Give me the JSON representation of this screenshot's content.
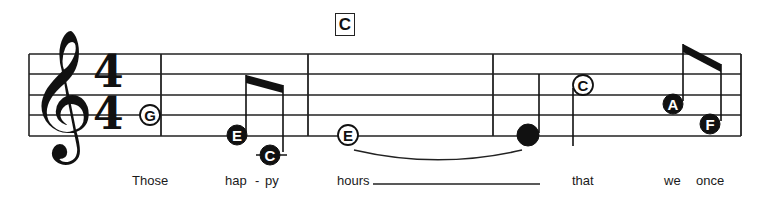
{
  "score": {
    "clef": "treble-clef",
    "clef_glyph": "𝄞",
    "time_signature": {
      "top": "4",
      "bottom": "4"
    },
    "chord_symbols": [
      {
        "label": "C",
        "x": 335
      }
    ],
    "staff": {
      "line_ys": [
        54,
        74,
        95,
        115,
        136
      ],
      "x_start": 29,
      "x_end": 741
    },
    "barlines": [
      161,
      308,
      493,
      741
    ],
    "notes": [
      {
        "letter": "G",
        "cx": 150,
        "cy": 115,
        "filled": false,
        "stem": null
      },
      {
        "letter": "E",
        "cx": 237,
        "cy": 135,
        "filled": true,
        "stem": {
          "x": 246,
          "y1": 133,
          "y2": 75
        }
      },
      {
        "letter": "C",
        "cx": 270,
        "cy": 155,
        "filled": true,
        "ledger": true,
        "stem": {
          "x": 283,
          "y1": 152,
          "y2": 85
        }
      },
      {
        "letter": "E",
        "cx": 348,
        "cy": 135,
        "filled": false,
        "stem": null
      },
      {
        "letter": "",
        "cx": 528,
        "cy": 135,
        "filled": true,
        "solid": true,
        "stem": {
          "x": 539,
          "y1": 133,
          "y2": 74
        }
      },
      {
        "letter": "C",
        "cx": 583,
        "cy": 85,
        "filled": false,
        "stem": {
          "x": 573,
          "y1": 88,
          "y2": 146
        }
      },
      {
        "letter": "A",
        "cx": 673,
        "cy": 104,
        "filled": true,
        "stem": {
          "x": 683,
          "y1": 101,
          "y2": 44
        }
      },
      {
        "letter": "F",
        "cx": 710,
        "cy": 124,
        "filled": true,
        "stem": {
          "x": 721,
          "y1": 121,
          "y2": 64
        }
      }
    ],
    "beams": [
      {
        "x1": 246,
        "y1": 75,
        "x2": 283,
        "y2": 85
      },
      {
        "x1": 683,
        "y1": 44,
        "x2": 721,
        "y2": 64
      }
    ],
    "ties": [
      {
        "x1": 354,
        "y1": 150,
        "x2": 522,
        "y2": 150,
        "depth": 14
      }
    ],
    "lyrics": [
      {
        "text": "Those",
        "x": 132
      },
      {
        "text": "hap",
        "x": 225
      },
      {
        "text": "-",
        "x": 255
      },
      {
        "text": "py",
        "x": 265
      },
      {
        "text": "hours",
        "x": 337
      },
      {
        "text": "that",
        "x": 572
      },
      {
        "text": "we",
        "x": 664
      },
      {
        "text": "once",
        "x": 696
      }
    ],
    "melisma_line": {
      "x1": 373,
      "x2": 540,
      "y": 184
    }
  }
}
